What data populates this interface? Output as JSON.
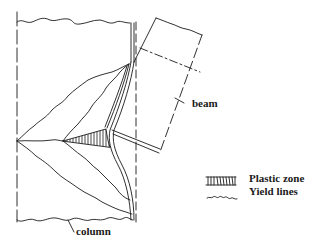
{
  "figure": {
    "labels": {
      "beam": "beam",
      "column": "column"
    },
    "legend": {
      "items": [
        {
          "symbol": "hatched-rectangle",
          "label": "Plastic zone"
        },
        {
          "symbol": "wavy-line",
          "label": "Yield lines"
        }
      ]
    },
    "colors": {
      "line": "#1a1a1a",
      "background": "#ffffff"
    }
  }
}
